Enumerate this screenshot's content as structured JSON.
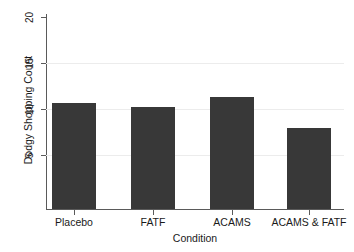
{
  "chart_data": {
    "type": "bar",
    "title": "",
    "subtitle": "",
    "xlabel": "Condition",
    "ylabel": "Dodgy Shopping Count",
    "categories": [
      "Placebo",
      "FATF",
      "ACAMS",
      "ACAMS & FATF"
    ],
    "values": [
      11.5,
      11.1,
      12.2,
      8.8
    ],
    "ylim": [
      0,
      21
    ],
    "yticks": [
      5,
      10,
      15,
      20
    ],
    "ytick_labels": [
      "5",
      "10",
      "15",
      "20"
    ],
    "grid": true,
    "grid_axis": "y",
    "legend": null,
    "legend_position": "none",
    "bar_color": "#383838",
    "gridline_color": "#ececec",
    "axis_color": "#5a5a5a",
    "background_color": "#ffffff",
    "ytick_label_rotation": 90,
    "ylabel_rotation": 90,
    "annotations": []
  }
}
